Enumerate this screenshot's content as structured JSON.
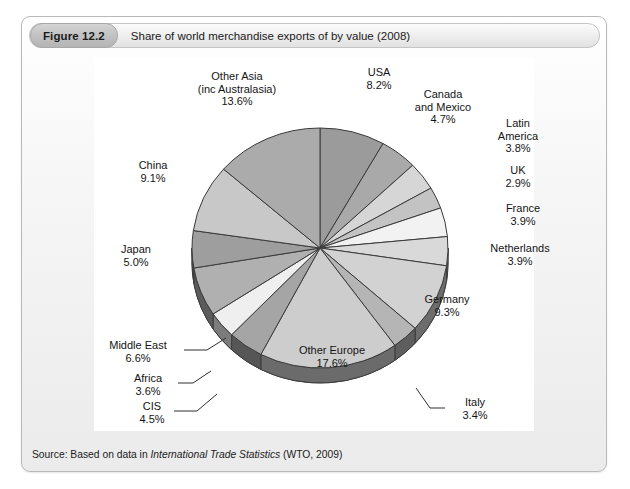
{
  "figure": {
    "number": "Figure 12.2",
    "title": "Share of world merchandise exports of by value (2008)",
    "source_prefix": "Source: Based on data in ",
    "source_italic": "International Trade Statistics",
    "source_suffix": " (WTO, 2009)"
  },
  "chart_data": {
    "type": "pie",
    "title": "Share of world merchandise exports of by value (2008)",
    "unit": "%",
    "legend": "none (direct labels)",
    "three_d": true,
    "start_angle_deg": 0,
    "direction": "clockwise",
    "categories": [
      "USA",
      "Canada and Mexico",
      "Latin America",
      "UK",
      "France",
      "Netherlands",
      "Germany",
      "Italy",
      "Other Europe",
      "CIS",
      "Africa",
      "Middle East",
      "Japan",
      "China",
      "Other Asia (inc Australasia)"
    ],
    "values": [
      8.2,
      4.7,
      3.8,
      2.9,
      3.9,
      3.9,
      9.3,
      3.4,
      17.6,
      4.5,
      3.6,
      6.6,
      5.0,
      9.1,
      13.6
    ],
    "slices": [
      {
        "label": "USA",
        "value": 8.2,
        "value_text": "8.2%",
        "fill": "#9b9b9b"
      },
      {
        "label": "Canada\nand Mexico",
        "value": 4.7,
        "value_text": "4.7%",
        "fill": "#a9a9a9"
      },
      {
        "label": "Latin\nAmerica",
        "value": 3.8,
        "value_text": "3.8%",
        "fill": "#d6d6d6"
      },
      {
        "label": "UK",
        "value": 2.9,
        "value_text": "2.9%",
        "fill": "#c3c3c3"
      },
      {
        "label": "France",
        "value": 3.9,
        "value_text": "3.9%",
        "fill": "#f2f2f2"
      },
      {
        "label": "Netherlands",
        "value": 3.9,
        "value_text": "3.9%",
        "fill": "#d9d9d9"
      },
      {
        "label": "Germany",
        "value": 9.3,
        "value_text": "9.3%",
        "fill": "#d2d2d2"
      },
      {
        "label": "Italy",
        "value": 3.4,
        "value_text": "3.4%",
        "fill": "#b5b5b5"
      },
      {
        "label": "Other Europe",
        "value": 17.6,
        "value_text": "17.6%",
        "fill": "#cdcdcd"
      },
      {
        "label": "CIS",
        "value": 4.5,
        "value_text": "4.5%",
        "fill": "#a5a5a5"
      },
      {
        "label": "Africa",
        "value": 3.6,
        "value_text": "3.6%",
        "fill": "#efefef"
      },
      {
        "label": "Middle East",
        "value": 6.6,
        "value_text": "6.6%",
        "fill": "#b0b0b0"
      },
      {
        "label": "Japan",
        "value": 5.0,
        "value_text": "5.0%",
        "fill": "#9e9e9e"
      },
      {
        "label": "China",
        "value": 9.1,
        "value_text": "9.1%",
        "fill": "#c8c8c8"
      },
      {
        "label": "Other Asia\n(inc Australasia)",
        "value": 13.6,
        "value_text": "13.6%",
        "fill": "#ababab"
      }
    ],
    "colors": {
      "rim": "#6e6e6e",
      "outline": "#3a3a3a",
      "background": "#ffffff"
    }
  },
  "labels": {
    "usa": {
      "name": "USA",
      "pct": "8.2%"
    },
    "canada": {
      "line1": "Canada",
      "line2": "and Mexico",
      "pct": "4.7%"
    },
    "latin": {
      "line1": "Latin",
      "line2": "America",
      "pct": "3.8%"
    },
    "uk": {
      "name": "UK",
      "pct": "2.9%"
    },
    "france": {
      "name": "France",
      "pct": "3.9%"
    },
    "netherlands": {
      "name": "Netherlands",
      "pct": "3.9%"
    },
    "germany": {
      "name": "Germany",
      "pct": "9.3%"
    },
    "italy": {
      "name": "Italy",
      "pct": "3.4%"
    },
    "other_europe": {
      "name": "Other Europe",
      "pct": "17.6%"
    },
    "cis": {
      "name": "CIS",
      "pct": "4.5%"
    },
    "africa": {
      "name": "Africa",
      "pct": "3.6%"
    },
    "middle_east": {
      "name": "Middle East",
      "pct": "6.6%"
    },
    "japan": {
      "name": "Japan",
      "pct": "5.0%"
    },
    "china": {
      "name": "China",
      "pct": "9.1%"
    },
    "other_asia": {
      "line1": "Other Asia",
      "line2": "(inc Australasia)",
      "pct": "13.6%"
    }
  }
}
